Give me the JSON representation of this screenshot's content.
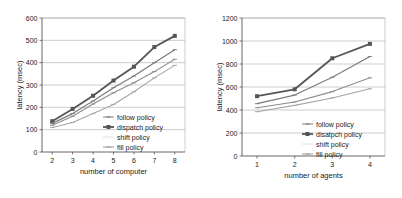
{
  "figure": {
    "background": "#ffffff",
    "panel_count": 2
  },
  "chart_data": [
    {
      "id": "left",
      "type": "line",
      "title": "",
      "xlabel": "number of computer",
      "ylabel": "latency (msec)",
      "x": [
        2,
        3,
        4,
        5,
        6,
        7,
        8
      ],
      "xticks": [
        "2",
        "3",
        "4",
        "5",
        "6",
        "7",
        "8"
      ],
      "xlim": [
        1.5,
        8.5
      ],
      "ylim": [
        0,
        600
      ],
      "yticks": [
        "0",
        "100",
        "200",
        "300",
        "400",
        "500",
        "600"
      ],
      "ytick_values": [
        0,
        100,
        200,
        300,
        400,
        500,
        600
      ],
      "grid": "horizontal",
      "legend_position": "lower-right-inside",
      "series": [
        {
          "name": "follow policy",
          "values": [
            120,
            160,
            215,
            265,
            310,
            360,
            415
          ],
          "color": "#8c8c8c",
          "marker": "none",
          "width": 1.1
        },
        {
          "name": "dispatch policy",
          "values": [
            138,
            193,
            252,
            320,
            382,
            470,
            520
          ],
          "color": "#555555",
          "marker": "square",
          "width": 1.8
        },
        {
          "name": "shift policy",
          "values": [
            128,
            172,
            228,
            288,
            340,
            400,
            458
          ],
          "color": "#7a7a7a",
          "marker": "none",
          "width": 1.2
        },
        {
          "name": "fill policy",
          "values": [
            110,
            132,
            172,
            213,
            270,
            332,
            388
          ],
          "color": "#a5a5a5",
          "marker": "none",
          "width": 1.1
        }
      ]
    },
    {
      "id": "right",
      "type": "line",
      "title": "",
      "xlabel": "number of agents",
      "ylabel": "latency (msec)",
      "x": [
        1,
        2,
        3,
        4
      ],
      "xticks": [
        "1",
        "2",
        "3",
        "4"
      ],
      "xlim": [
        0.6,
        4.4
      ],
      "ylim": [
        0,
        1200
      ],
      "yticks": [
        "0",
        "200",
        "400",
        "600",
        "800",
        "1000",
        "1200"
      ],
      "ytick_values": [
        0,
        200,
        400,
        600,
        800,
        1000,
        1200
      ],
      "grid": "horizontal",
      "legend_position": "lower-right-inside",
      "series": [
        {
          "name": "follow policy",
          "values": [
            420,
            470,
            560,
            680
          ],
          "color": "#8c8c8c",
          "marker": "none",
          "width": 1.1
        },
        {
          "name": "disatpch policy",
          "values": [
            520,
            580,
            850,
            975
          ],
          "color": "#555555",
          "marker": "square",
          "width": 1.8
        },
        {
          "name": "shift policy",
          "values": [
            455,
            530,
            685,
            865
          ],
          "color": "#7a7a7a",
          "marker": "none",
          "width": 1.2
        },
        {
          "name": "fill policy",
          "values": [
            385,
            440,
            505,
            585
          ],
          "color": "#a5a5a5",
          "marker": "none",
          "width": 1.1
        }
      ]
    }
  ]
}
